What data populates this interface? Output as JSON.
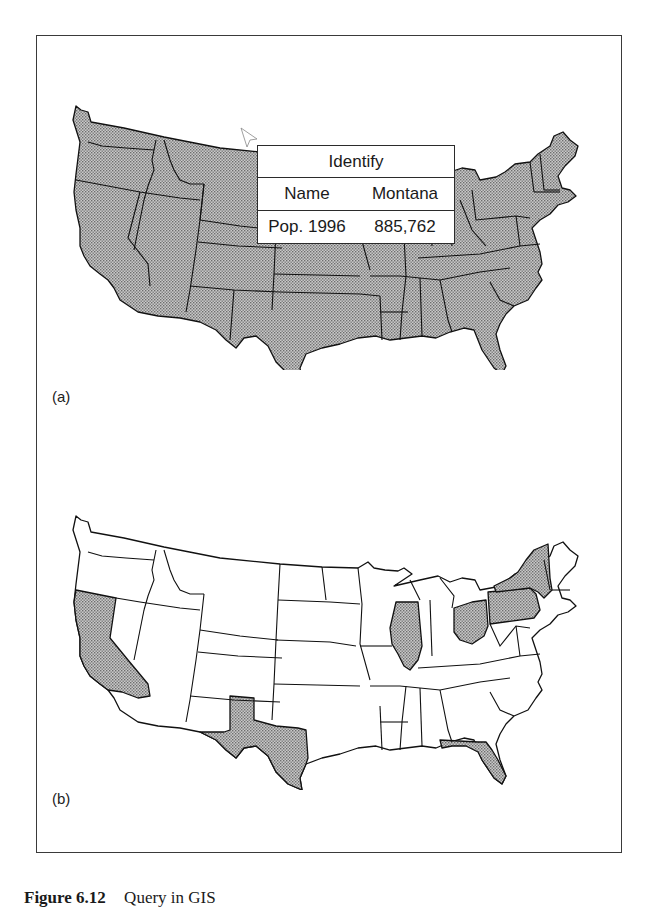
{
  "figure": {
    "panels": [
      {
        "label": "(a)",
        "description": "All states shaded; Identify query on Montana",
        "fill_color": "#b8b8b8",
        "identify_popup": {
          "title": "Identify",
          "rows": [
            {
              "field": "Name",
              "value": "Montana"
            },
            {
              "field": "Pop. 1996",
              "value": "885,762"
            }
          ]
        },
        "cursor": "arrow-pointer"
      },
      {
        "label": "(b)",
        "description": "Selected states highlighted",
        "fill_color": "#b8b8b8",
        "highlighted_states": [
          "California",
          "Texas",
          "Florida",
          "Illinois",
          "Ohio",
          "Pennsylvania",
          "New York"
        ]
      }
    ],
    "caption": {
      "number": "Figure 6.12",
      "text": "Query in GIS"
    }
  }
}
